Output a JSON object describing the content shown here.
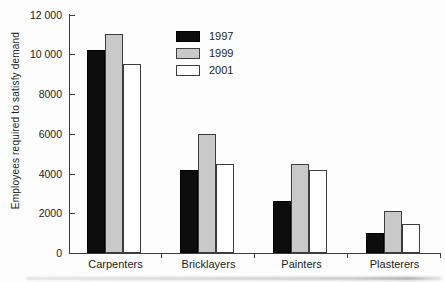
{
  "chart_data": {
    "type": "bar",
    "title": "",
    "ylabel": "Employees required to satisfy demand",
    "xlabel": "",
    "categories": [
      "Carpenters",
      "Bricklayers",
      "Painters",
      "Plasterers"
    ],
    "series": [
      {
        "name": "1997",
        "color": "#0d0d0d",
        "border": "#000000",
        "values": [
          10200,
          4200,
          2600,
          1000
        ]
      },
      {
        "name": "1999",
        "color": "#c9c9c9",
        "border": "#3d3d3d",
        "values": [
          11000,
          6000,
          4500,
          2100
        ]
      },
      {
        "name": "2001",
        "color": "#ffffff",
        "border": "#3d3d3d",
        "values": [
          9500,
          4500,
          4200,
          1450
        ]
      }
    ],
    "ylim": [
      0,
      12000
    ],
    "ytick_values": [
      0,
      2000,
      4000,
      6000,
      8000,
      10000,
      12000
    ],
    "ytick_labels": [
      "0",
      "2000",
      "4000",
      "6000",
      "8000",
      "10 000",
      "12 000"
    ],
    "legend_position": "upper-center-left",
    "grid": false,
    "axis_color": "#3d3d3d",
    "text_color": "#1c1c1c"
  }
}
